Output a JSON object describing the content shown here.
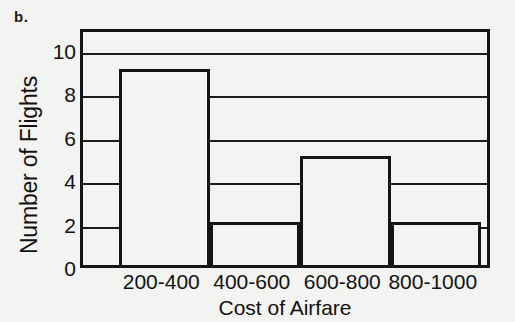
{
  "figure": {
    "panel_label": "b."
  },
  "chart_data": {
    "type": "bar",
    "title": "",
    "subtitle": "",
    "xlabel": "Cost of Airfare",
    "ylabel": "Number of Flights",
    "categories": [
      "200-400",
      "400-600",
      "600-800",
      "800-1000"
    ],
    "values": [
      9,
      2,
      5,
      2
    ],
    "series": [
      {
        "name": "Number of Flights",
        "values": [
          9,
          2,
          5,
          2
        ]
      }
    ],
    "ylim": [
      0,
      11
    ],
    "xlim": [
      0,
      1
    ],
    "ytick_labels": [
      "0",
      "2",
      "4",
      "6",
      "8",
      "10"
    ],
    "ytick_values": [
      0,
      2,
      4,
      6,
      8,
      10
    ],
    "gridlines_y": [
      2,
      4,
      6,
      8,
      10
    ],
    "grid": true,
    "legend": false,
    "legend_position": "none",
    "bar_fill_color": "#f3f3f2",
    "bar_edge_color": "#141414",
    "axis_color": "#151515",
    "background_color": "#f3f3f2",
    "annotations": []
  }
}
